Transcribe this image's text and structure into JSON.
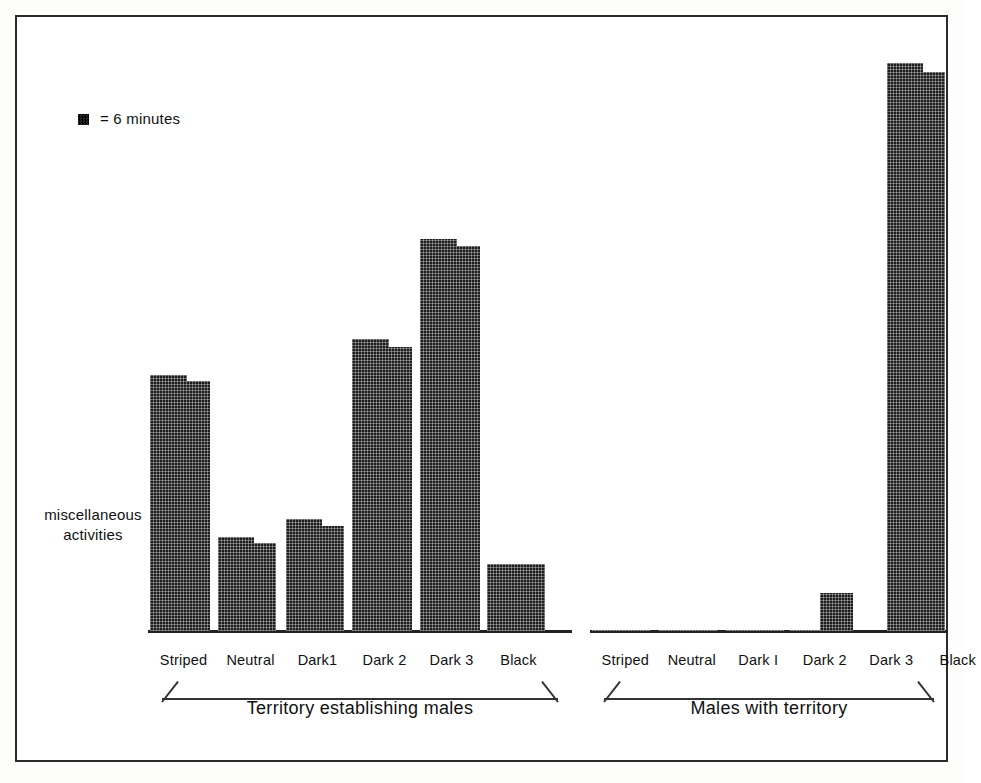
{
  "legend": {
    "marker": "square-swatch-icon",
    "text": "= 6 minutes",
    "unit_minutes": 6
  },
  "axis": {
    "y_label_line1": "miscellaneous",
    "y_label_line2": "activities"
  },
  "groups": [
    {
      "caption": "Territory establishing males"
    },
    {
      "caption": "Males with territory"
    }
  ],
  "chart_data": {
    "type": "bar",
    "title": "",
    "subtitle": "",
    "xlabel": "",
    "ylabel": "miscellaneous activities",
    "unit": "minutes",
    "unit_per_marker": 6,
    "grid": false,
    "legend_position": "top-left",
    "ylim": [
      0,
      102
    ],
    "categories": [
      "Striped",
      "Neutral",
      "Dark1",
      "Dark 2",
      "Dark 3",
      "Black"
    ],
    "groups": [
      "Territory establishing males",
      "Males with territory"
    ],
    "series": [
      {
        "name": "Territory establishing males",
        "categories": [
          "Striped",
          "Neutral",
          "Dark1",
          "Dark 2",
          "Dark 3",
          "Black"
        ],
        "values": [
          45,
          16,
          19,
          51,
          69,
          12
        ]
      },
      {
        "name": "Males with territory",
        "categories": [
          "Striped",
          "Neutral",
          "Dark I",
          "Dark 2",
          "Dark 3",
          "Black"
        ],
        "values": [
          0,
          0,
          0,
          0,
          7,
          100
        ]
      }
    ],
    "annotations": [
      "= 6 minutes"
    ]
  },
  "left_group": {
    "caption": "Territory establishing males",
    "bars": [
      {
        "label": "Striped",
        "x": 150,
        "w": 60,
        "top": 375,
        "step_top": 381
      },
      {
        "label": "Neutral",
        "x": 218,
        "w": 58,
        "top": 537,
        "step_top": 543
      },
      {
        "label": "Dark1",
        "x": 286,
        "w": 58,
        "top": 519,
        "step_top": 526
      },
      {
        "label": "Dark 2",
        "x": 352,
        "w": 60,
        "top": 339,
        "step_top": 347
      },
      {
        "label": "Dark 3",
        "x": 420,
        "w": 60,
        "top": 239,
        "step_top": 246
      },
      {
        "label": "Black",
        "x": 487,
        "w": 58,
        "top": 564,
        "step_top": 564
      }
    ]
  },
  "right_group": {
    "caption": "Males with territory",
    "bars": [
      {
        "label": "Striped",
        "x": 592,
        "w": 58,
        "top": 630,
        "step_top": 630
      },
      {
        "label": "Neutral",
        "x": 659,
        "w": 58,
        "top": 630,
        "step_top": 630
      },
      {
        "label": "Dark I",
        "x": 726,
        "w": 58,
        "top": 630,
        "step_top": 630
      },
      {
        "label": "Dark 2",
        "x": 790,
        "w": 58,
        "top": 630,
        "step_top": 630
      },
      {
        "label": "Dark 3",
        "x": 820,
        "w": 33,
        "top": 593,
        "step_top": 593
      },
      {
        "label": "Black",
        "x": 887,
        "w": 58,
        "top": 63,
        "step_top": 72
      }
    ]
  },
  "colors": {
    "ink": "#1c1c1c",
    "frame": "#2b2b2b",
    "paper": "#ffffff"
  }
}
